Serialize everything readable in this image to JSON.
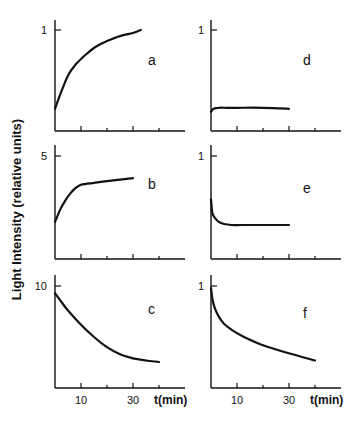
{
  "figure": {
    "ylabel": "Light Intensity (relative units)",
    "xlabel": "t(min)",
    "x_tick_labels": [
      "10",
      "30"
    ]
  },
  "chart_data": [
    {
      "type": "line",
      "panel": "a",
      "title": "a",
      "xlabel": "",
      "ylabel": "Light Intensity (relative units)",
      "y_tick_label": "1",
      "y_tick_value": 1,
      "xlim": [
        0,
        50
      ],
      "ylim": [
        0,
        1.1
      ],
      "x": [
        0,
        2,
        5,
        8,
        12,
        16,
        20,
        25,
        30,
        33
      ],
      "values": [
        0.22,
        0.36,
        0.55,
        0.66,
        0.76,
        0.84,
        0.89,
        0.94,
        0.97,
        1.0
      ],
      "grid": false
    },
    {
      "type": "line",
      "panel": "b",
      "title": "b",
      "xlabel": "",
      "ylabel": "Light Intensity (relative units)",
      "y_tick_label": "5",
      "y_tick_value": 5,
      "xlim": [
        0,
        50
      ],
      "ylim": [
        0,
        5.5
      ],
      "x": [
        0,
        2,
        4,
        6,
        8,
        10,
        12,
        15,
        20,
        25,
        30
      ],
      "values": [
        1.8,
        2.4,
        2.85,
        3.2,
        3.45,
        3.6,
        3.65,
        3.7,
        3.78,
        3.85,
        3.92
      ],
      "grid": false
    },
    {
      "type": "line",
      "panel": "c",
      "title": "c",
      "xlabel": "t(min)",
      "ylabel": "Light Intensity (relative units)",
      "y_tick_label": "10",
      "y_tick_value": 10,
      "xlim": [
        0,
        50
      ],
      "ylim": [
        0,
        11
      ],
      "x_tick_labels": [
        "10",
        "30"
      ],
      "x": [
        0,
        2,
        5,
        10,
        15,
        20,
        25,
        30,
        35,
        40
      ],
      "values": [
        9.3,
        8.6,
        7.6,
        6.2,
        5.0,
        4.0,
        3.3,
        2.9,
        2.7,
        2.55
      ],
      "grid": false
    },
    {
      "type": "line",
      "panel": "d",
      "title": "d",
      "xlabel": "",
      "ylabel": "",
      "y_tick_label": "1",
      "y_tick_value": 1,
      "xlim": [
        0,
        50
      ],
      "ylim": [
        0,
        1.1
      ],
      "x": [
        0,
        1,
        3,
        6,
        10,
        20,
        30
      ],
      "values": [
        0.19,
        0.22,
        0.23,
        0.23,
        0.23,
        0.23,
        0.22
      ],
      "grid": false
    },
    {
      "type": "line",
      "panel": "e",
      "title": "e",
      "xlabel": "",
      "ylabel": "",
      "y_tick_label": "1",
      "y_tick_value": 1,
      "xlim": [
        0,
        50
      ],
      "ylim": [
        0,
        1.1
      ],
      "x": [
        0,
        0.5,
        1.5,
        3,
        5,
        8,
        12,
        20,
        30
      ],
      "values": [
        0.58,
        0.45,
        0.4,
        0.36,
        0.34,
        0.33,
        0.33,
        0.33,
        0.33
      ],
      "grid": false
    },
    {
      "type": "line",
      "panel": "f",
      "title": "f",
      "xlabel": "t(min)",
      "ylabel": "",
      "y_tick_label": "1",
      "y_tick_value": 1,
      "xlim": [
        0,
        50
      ],
      "ylim": [
        0,
        1.1
      ],
      "x_tick_labels": [
        "10",
        "30"
      ],
      "x": [
        0,
        0.5,
        1.5,
        3,
        5,
        8,
        12,
        20,
        30,
        40
      ],
      "values": [
        0.98,
        0.88,
        0.78,
        0.7,
        0.63,
        0.57,
        0.51,
        0.42,
        0.34,
        0.27
      ],
      "grid": false
    }
  ]
}
